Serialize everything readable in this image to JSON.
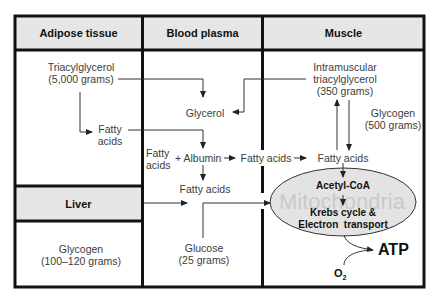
{
  "columns": [
    {
      "id": "adipose",
      "header": "Adipose tissue"
    },
    {
      "id": "plasma",
      "header": "Blood plasma"
    },
    {
      "id": "muscle",
      "header": "Muscle"
    }
  ],
  "liver": {
    "header": "Liver",
    "glycogen": {
      "line1": "Glycogen",
      "line2": "(100–120 grams)"
    }
  },
  "adipose": {
    "triacylglycerol": {
      "line1": "Triacylglycerol",
      "line2": "(5,000 grams)"
    },
    "fatty_acids": {
      "line1": "Fatty",
      "line2": "acids"
    }
  },
  "plasma": {
    "glycerol": "Glycerol",
    "fatty_acids_bound": {
      "line1": "Fatty",
      "line2": "acids"
    },
    "plus_albumin": "+ Albumin",
    "fatty_acids_free": "Fatty acids",
    "fatty_acids_lower": "Fatty acids",
    "glucose": {
      "line1": "Glucose",
      "line2": "(25 grams)"
    }
  },
  "muscle": {
    "intramuscular": {
      "line1": "Intramuscular",
      "line2": "triacylglycerol",
      "line3": "(350 grams)"
    },
    "glycogen": {
      "line1": "Glycogen",
      "line2": "(500 grams)"
    },
    "fatty_acids": "Fatty acids",
    "mitochondria": {
      "watermark": "Mitochondria",
      "acetyl_coa": "Acetyl-CoA",
      "krebs_line1": "Krebs cycle &",
      "krebs_line2": "Electron  transport"
    },
    "atp": "ATP",
    "o2": "O",
    "o2_sub": "2"
  },
  "colors": {
    "border": "#111111",
    "header_fill": "#e6e6e6",
    "ellipse_fill": "#e3e3e3",
    "text": "#3c3c3c",
    "watermark": "#c9c9c9"
  }
}
